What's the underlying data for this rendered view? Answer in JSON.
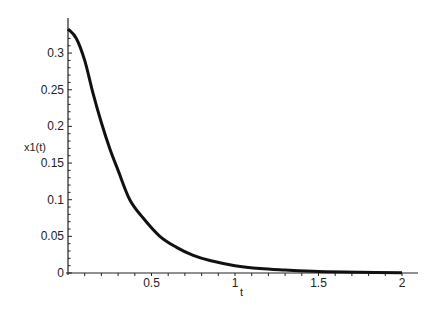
{
  "chart_data": {
    "type": "line",
    "title": "",
    "xlabel": "t",
    "ylabel": "x1(t)",
    "xlim": [
      0,
      2.1
    ],
    "ylim": [
      0,
      0.34
    ],
    "grid": false,
    "legend": "none",
    "x_ticks": [
      "0.5",
      "1",
      "1.5",
      "2"
    ],
    "y_ticks": [
      "0",
      "0.05",
      "0.1",
      "0.15",
      "0.2",
      "0.25",
      "0.3"
    ],
    "series": [
      {
        "name": "x1(t)",
        "color": "#111111",
        "x": [
          0,
          0.05,
          0.1,
          0.15,
          0.2,
          0.25,
          0.3,
          0.37,
          0.45,
          0.55,
          0.65,
          0.75,
          0.85,
          1.0,
          1.15,
          1.3,
          1.5,
          1.75,
          2.0
        ],
        "y": [
          0.333,
          0.32,
          0.29,
          0.245,
          0.205,
          0.17,
          0.14,
          0.1,
          0.075,
          0.05,
          0.035,
          0.024,
          0.017,
          0.01,
          0.006,
          0.004,
          0.002,
          0.001,
          0.0005
        ]
      }
    ]
  },
  "axes": {
    "x_title": "t",
    "y_title": "x1(t)",
    "y_zero_label": "0"
  }
}
